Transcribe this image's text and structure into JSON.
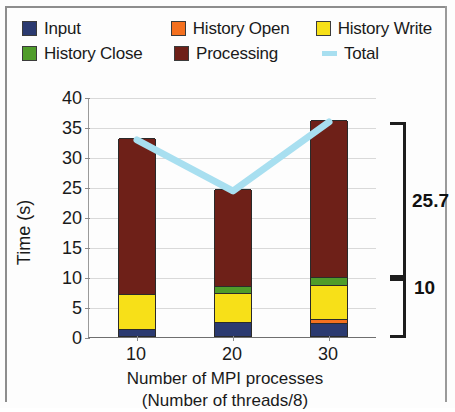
{
  "legend": {
    "rows": [
      [
        {
          "name": "input",
          "label": "Input",
          "color": "#2b3a70",
          "type": "box"
        },
        {
          "name": "history-open",
          "label": "History Open",
          "color": "#f4701f",
          "type": "box"
        },
        {
          "name": "history-write",
          "label": "History Write",
          "color": "#f7e018",
          "type": "box"
        }
      ],
      [
        {
          "name": "history-close",
          "label": "History Close",
          "color": "#4f9c2a",
          "type": "box"
        },
        {
          "name": "processing",
          "label": "Processing",
          "color": "#6e2018",
          "type": "box"
        },
        {
          "name": "total",
          "label": "Total",
          "color": "#a8dff0",
          "type": "line"
        }
      ]
    ]
  },
  "axes": {
    "y_title": "Time (s)",
    "y_ticks": [
      "0",
      "5",
      "10",
      "15",
      "20",
      "25",
      "30",
      "35",
      "40"
    ],
    "x_ticks": [
      "10",
      "20",
      "30"
    ],
    "x_title_line1": "Number of MPI processes",
    "x_title_line2": "(Number of threads/8)"
  },
  "annotations": [
    {
      "name": "bracket-upper",
      "label": "25.7"
    },
    {
      "name": "bracket-lower",
      "label": "10"
    }
  ],
  "chart_data": {
    "type": "bar",
    "title": "",
    "xlabel": "Number of MPI processes (Number of threads/8)",
    "ylabel": "Time (s)",
    "ylim": [
      0,
      40
    ],
    "ytick_step": 5,
    "grid": true,
    "legend_position": "top",
    "stacked": true,
    "categories": [
      "10",
      "20",
      "30"
    ],
    "series": [
      {
        "name": "Input",
        "color": "#2b3a70",
        "values": [
          1.2,
          2.3,
          2.2
        ]
      },
      {
        "name": "History Open",
        "color": "#f4701f",
        "values": [
          0.0,
          0.0,
          0.6
        ]
      },
      {
        "name": "History Write",
        "color": "#f7e018",
        "values": [
          5.8,
          4.9,
          5.7
        ]
      },
      {
        "name": "History Close",
        "color": "#4f9c2a",
        "values": [
          0.0,
          1.2,
          1.3
        ]
      },
      {
        "name": "Processing",
        "color": "#6e2018",
        "values": [
          26.0,
          16.1,
          26.2
        ]
      }
    ],
    "overlay_series": [
      {
        "name": "Total",
        "color": "#a8dff0",
        "type": "line",
        "values": [
          33.0,
          24.5,
          36.0
        ]
      }
    ],
    "totals": [
      33.0,
      24.5,
      36.0
    ],
    "annotations": [
      {
        "label": "25.7",
        "span": [
          10.0,
          36.0
        ],
        "kind": "bracket"
      },
      {
        "label": "10",
        "span": [
          0.0,
          10.0
        ],
        "kind": "bracket"
      }
    ]
  }
}
